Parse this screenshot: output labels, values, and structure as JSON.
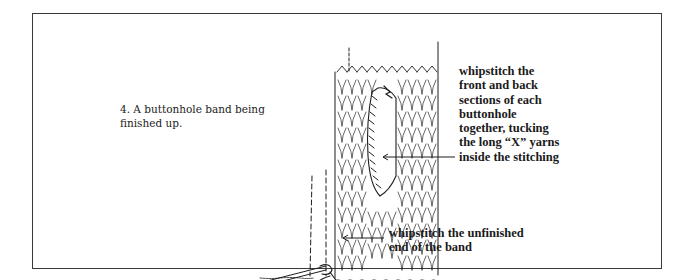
{
  "figure": {
    "caption": {
      "lines": [
        "4. A buttonhole band being",
        "finished up."
      ]
    },
    "annotations": {
      "buttonhole": {
        "lines": [
          "whipstitch the",
          "front and back",
          "sections of each",
          "buttonhole",
          "together, tucking",
          "the long “X” yarns",
          "inside the stitching"
        ]
      },
      "band_end": {
        "lines": [
          "whipstitch the unfinished",
          "end of the band"
        ]
      }
    },
    "illustration": {
      "subject": "knitted buttonhole band with needle and yarn",
      "ink_color": "#1e1e1e"
    }
  }
}
